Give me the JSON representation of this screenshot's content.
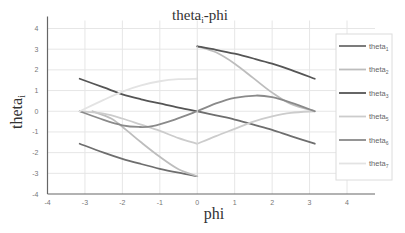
{
  "chart_data": {
    "type": "line",
    "title_main": "theta",
    "title_sub": "i",
    "title_suffix": "-phi",
    "xlabel": "phi",
    "ylabel_main": "theta",
    "ylabel_sub": "i",
    "xlim": [
      -4,
      4
    ],
    "ylim": [
      -4,
      4
    ],
    "xticks": [
      -4,
      -3,
      -2,
      -1,
      0,
      1,
      2,
      3,
      4
    ],
    "yticks": [
      -4,
      -3,
      -2,
      -1,
      0,
      1,
      2,
      3,
      4
    ],
    "grid": true,
    "legend_position": "right",
    "series": [
      {
        "name": "theta1",
        "label_main": "theta",
        "label_sub": "1",
        "color": "#6e6e6e",
        "segments": [
          [
            [
              -3.14,
              -1.57
            ],
            [
              -2.5,
              -2.0
            ],
            [
              -2.0,
              -2.3
            ],
            [
              -1.5,
              -2.55
            ],
            [
              -1.0,
              -2.78
            ],
            [
              -0.5,
              -2.97
            ],
            [
              0,
              -3.14
            ]
          ],
          [
            [
              0,
              0
            ],
            [
              0.5,
              -0.2
            ],
            [
              1.0,
              -0.4
            ],
            [
              1.5,
              -0.65
            ],
            [
              2.0,
              -0.9
            ],
            [
              2.5,
              -1.2
            ],
            [
              3.14,
              -1.57
            ]
          ]
        ]
      },
      {
        "name": "theta2",
        "label_main": "theta",
        "label_sub": "2",
        "color": "#bdbdbd",
        "segments": [
          [
            [
              -2.8,
              0
            ],
            [
              -2.3,
              -0.35
            ],
            [
              -1.9,
              -0.9
            ],
            [
              -1.5,
              -1.5
            ],
            [
              -1.0,
              -2.2
            ],
            [
              -0.5,
              -2.8
            ],
            [
              0,
              -3.14
            ]
          ],
          [
            [
              0,
              3.14
            ],
            [
              0.5,
              2.85
            ],
            [
              1.0,
              2.3
            ],
            [
              1.5,
              1.6
            ],
            [
              2.0,
              0.9
            ],
            [
              2.5,
              0.35
            ],
            [
              3.14,
              0
            ]
          ]
        ]
      },
      {
        "name": "theta3",
        "label_main": "theta",
        "label_sub": "3",
        "color": "#555555",
        "segments": [
          [
            [
              -3.14,
              1.57
            ],
            [
              -2.5,
              1.15
            ],
            [
              -2.0,
              0.82
            ],
            [
              -1.5,
              0.58
            ],
            [
              -1.0,
              0.38
            ],
            [
              -0.5,
              0.18
            ],
            [
              0,
              0
            ]
          ],
          [
            [
              0,
              3.14
            ],
            [
              0.5,
              2.97
            ],
            [
              1.0,
              2.78
            ],
            [
              1.5,
              2.55
            ],
            [
              2.0,
              2.3
            ],
            [
              2.5,
              2.0
            ],
            [
              3.14,
              1.57
            ]
          ]
        ]
      },
      {
        "name": "theta5",
        "label_main": "theta",
        "label_sub": "5",
        "color": "#cccccc",
        "segments": [
          [
            [
              -3.14,
              0
            ],
            [
              -2.5,
              -0.12
            ],
            [
              -2.0,
              -0.35
            ],
            [
              -1.5,
              -0.65
            ],
            [
              -1.0,
              -0.95
            ],
            [
              -0.5,
              -1.3
            ],
            [
              0,
              -1.57
            ]
          ],
          [
            [
              0,
              -1.57
            ],
            [
              0.5,
              -1.2
            ],
            [
              1.0,
              -0.85
            ],
            [
              1.5,
              -0.5
            ],
            [
              2.0,
              -0.25
            ],
            [
              2.5,
              -0.08
            ],
            [
              3.14,
              0
            ]
          ]
        ]
      },
      {
        "name": "theta6",
        "label_main": "theta",
        "label_sub": "6",
        "color": "#8a8a8a",
        "segments": [
          [
            [
              -3.14,
              0
            ],
            [
              -2.5,
              -0.42
            ],
            [
              -2.0,
              -0.68
            ],
            [
              -1.57,
              -0.76
            ],
            [
              -1.2,
              -0.72
            ],
            [
              -0.6,
              -0.4
            ],
            [
              0,
              0
            ]
          ],
          [
            [
              0,
              0
            ],
            [
              0.5,
              0.38
            ],
            [
              1.0,
              0.65
            ],
            [
              1.57,
              0.76
            ],
            [
              2.0,
              0.68
            ],
            [
              2.5,
              0.42
            ],
            [
              3.14,
              0
            ]
          ]
        ]
      },
      {
        "name": "theta7",
        "label_main": "theta",
        "label_sub": "7",
        "color": "#e3e3e3",
        "segments": [
          [
            [
              -3.14,
              0
            ],
            [
              -2.5,
              0.55
            ],
            [
              -2.0,
              0.95
            ],
            [
              -1.5,
              1.25
            ],
            [
              -1.0,
              1.45
            ],
            [
              -0.5,
              1.55
            ],
            [
              0,
              1.57
            ]
          ]
        ]
      }
    ]
  }
}
